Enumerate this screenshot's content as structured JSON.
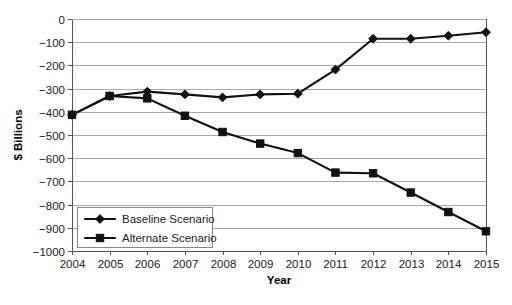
{
  "chart_data": {
    "type": "line",
    "title": "",
    "xlabel": "Year",
    "ylabel": "$ Billions",
    "categories": [
      "2004",
      "2005",
      "2006",
      "2007",
      "2008",
      "2009",
      "2010",
      "2011",
      "2012",
      "2013",
      "2014",
      "2015"
    ],
    "x": [
      2004,
      2005,
      2006,
      2007,
      2008,
      2009,
      2010,
      2011,
      2012,
      2013,
      2014,
      2015
    ],
    "series": [
      {
        "name": "Baseline Scenario",
        "marker": "diamond",
        "color": "#111111",
        "values": [
          -413,
          -332,
          -313,
          -325,
          -338,
          -325,
          -322,
          -218,
          -85,
          -85,
          -72,
          -57
        ]
      },
      {
        "name": "Alternate Scenario",
        "marker": "square",
        "color": "#111111",
        "values": [
          -413,
          -332,
          -342,
          -417,
          -487,
          -537,
          -578,
          -662,
          -665,
          -748,
          -832,
          -915
        ]
      }
    ],
    "ylim": [
      -1000,
      0
    ],
    "ytick_values": [
      0,
      -100,
      -200,
      -300,
      -400,
      -500,
      -600,
      -700,
      -800,
      -900,
      -1000
    ],
    "ytick_labels": [
      "0",
      "−100",
      "−200",
      "−300",
      "−400",
      "−500",
      "−600",
      "−700",
      "−800",
      "−900",
      "−1000"
    ],
    "grid": true,
    "grid_axis": "y",
    "legend_position": "bottom-left",
    "legend_entries": [
      "Baseline Scenario",
      "Alternate Scenario"
    ]
  }
}
